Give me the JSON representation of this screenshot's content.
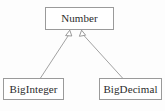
{
  "diagram": {
    "kind": "uml-class-diagram",
    "background_color": "#fdfdfd",
    "line_color": "#9a9a9a",
    "text_color": "#2b2b2b",
    "nodes": [
      {
        "id": "number",
        "label": "Number",
        "role": "superclass"
      },
      {
        "id": "biginteger",
        "label": "BigInteger",
        "role": "subclass"
      },
      {
        "id": "bigdecimal",
        "label": "BigDecimal",
        "role": "subclass"
      }
    ],
    "edges": [
      {
        "id": "biginteger-extends-number",
        "from": "biginteger",
        "to": "number",
        "relation": "generalization",
        "arrow": "hollow-triangle"
      },
      {
        "id": "bigdecimal-extends-number",
        "from": "bigdecimal",
        "to": "number",
        "relation": "generalization",
        "arrow": "hollow-triangle"
      }
    ]
  }
}
